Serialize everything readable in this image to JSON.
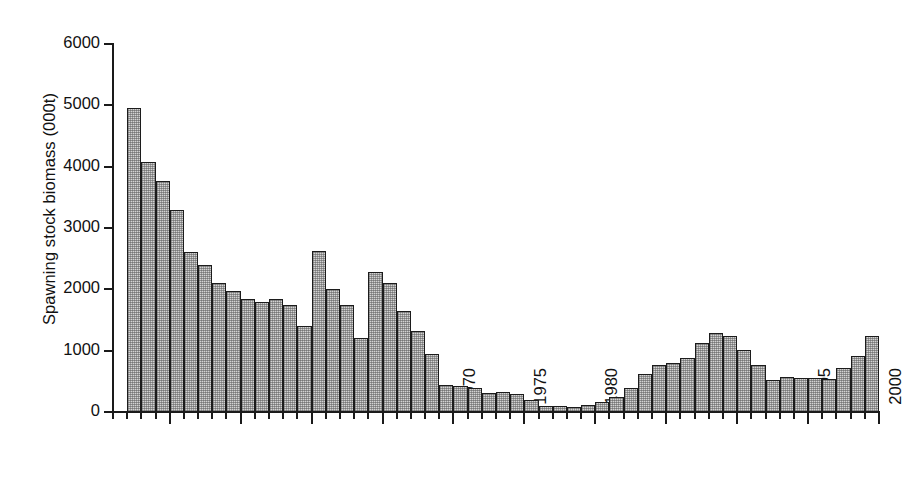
{
  "chart_data": {
    "type": "bar",
    "title": "",
    "xlabel": "",
    "ylabel": "Spawning stock biomass (000t)",
    "ylim": [
      0,
      6000
    ],
    "xlim": [
      1946,
      2000
    ],
    "yticks": [
      0,
      1000,
      2000,
      3000,
      4000,
      5000,
      6000
    ],
    "ytick_labels": [
      "0",
      "1000",
      "2000",
      "3000",
      "4000",
      "5000",
      "6000"
    ],
    "xticks": [
      1950,
      1955,
      1960,
      1965,
      1970,
      1975,
      1980,
      1985,
      1990,
      1995,
      2000
    ],
    "xtick_labels": [
      "1950",
      "1955",
      "1960",
      "1965",
      "1970",
      "1975",
      "1980",
      "1985",
      "1990",
      "1995",
      "2000"
    ],
    "grid": false,
    "legend": null,
    "bar_fill": "#d3d3d3",
    "bar_edge": "#1c1c1c",
    "categories": [
      1947,
      1948,
      1949,
      1950,
      1951,
      1952,
      1953,
      1954,
      1955,
      1956,
      1957,
      1958,
      1959,
      1960,
      1961,
      1962,
      1963,
      1964,
      1965,
      1966,
      1967,
      1968,
      1969,
      1970,
      1971,
      1972,
      1973,
      1974,
      1975,
      1976,
      1977,
      1978,
      1979,
      1980,
      1981,
      1982,
      1983,
      1984,
      1985,
      1986,
      1987,
      1988,
      1989,
      1990,
      1991,
      1992,
      1993,
      1994,
      1995,
      1996,
      1997,
      1998,
      1999
    ],
    "values": [
      4950,
      4070,
      3760,
      3290,
      2610,
      2400,
      2110,
      1970,
      1840,
      1800,
      1840,
      1740,
      1400,
      2620,
      2010,
      1740,
      1200,
      2280,
      2100,
      1650,
      1320,
      950,
      440,
      430,
      390,
      310,
      320,
      300,
      200,
      100,
      90,
      80,
      110,
      160,
      240,
      390,
      620,
      760,
      800,
      880,
      1130,
      1290,
      1240,
      1010,
      770,
      530,
      570,
      550,
      550,
      540,
      720,
      920,
      1240
    ]
  }
}
